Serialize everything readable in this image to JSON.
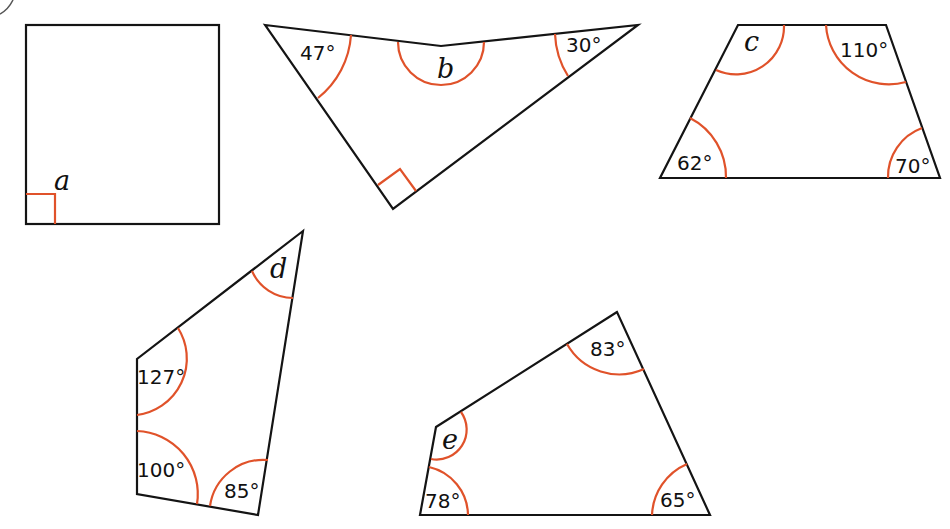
{
  "colors": {
    "edge": "#141414",
    "arc": "#e0522a",
    "background": "#ffffff"
  },
  "shapes": {
    "a": {
      "type": "square",
      "unknown": "a",
      "angles": [
        "90°"
      ]
    },
    "b": {
      "type": "arrowhead quadrilateral (concave)",
      "unknown": "b",
      "known": [
        "47°",
        "30°",
        "90°"
      ]
    },
    "c": {
      "type": "trapezium",
      "unknown": "c",
      "known": [
        "110°",
        "62°",
        "70°"
      ]
    },
    "d": {
      "type": "quadrilateral",
      "unknown": "d",
      "known": [
        "127°",
        "100°",
        "85°"
      ]
    },
    "e": {
      "type": "quadrilateral",
      "unknown": "e",
      "known": [
        "83°",
        "78°",
        "65°"
      ]
    }
  },
  "labels": {
    "a": "a",
    "b": "b",
    "b_47": "47°",
    "b_30": "30°",
    "c": "c",
    "c_110": "110°",
    "c_62": "62°",
    "c_70": "70°",
    "d": "d",
    "d_127": "127°",
    "d_100": "100°",
    "d_85": "85°",
    "e": "e",
    "e_83": "83°",
    "e_78": "78°",
    "e_65": "65°"
  }
}
